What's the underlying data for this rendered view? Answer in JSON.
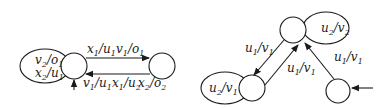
{
  "diagrams": [
    {
      "name": "left-automaton",
      "states": [
        {
          "id": "A",
          "initial": true
        },
        {
          "id": "B",
          "initial": false
        }
      ],
      "transitions": [
        {
          "from": "A",
          "to": "A",
          "labels": [
            {
              "in": "v",
              "in_sub": "2",
              "out": "o",
              "out_sub": "1"
            },
            {
              "in": "x",
              "in_sub": "2",
              "out": "u",
              "out_sub": "1"
            }
          ]
        },
        {
          "from": "A",
          "to": "B",
          "labels": [
            {
              "in": "x",
              "in_sub": "1",
              "out": "u",
              "out_sub": "1"
            },
            {
              "in": "v",
              "in_sub": "1",
              "out": "o",
              "out_sub": "1"
            }
          ]
        },
        {
          "from": "B",
          "to": "A",
          "labels": [
            {
              "in": "v",
              "in_sub": "1",
              "out": "u",
              "out_sub": "1"
            },
            {
              "in": "x",
              "in_sub": "1",
              "out": "u",
              "out_sub": "2"
            },
            {
              "in": "x",
              "in_sub": "2",
              "out": "o",
              "out_sub": "2"
            }
          ]
        }
      ]
    },
    {
      "name": "right-automaton",
      "states": [
        {
          "id": "T",
          "initial": false
        },
        {
          "id": "L",
          "initial": false
        },
        {
          "id": "R",
          "initial": true
        }
      ],
      "transitions": [
        {
          "from": "T",
          "to": "T",
          "labels": [
            {
              "in": "u",
              "in_sub": "2",
              "out": "v",
              "out_sub": "2"
            }
          ]
        },
        {
          "from": "T",
          "to": "L",
          "labels": [
            {
              "in": "u",
              "in_sub": "1",
              "out": "v",
              "out_sub": "1"
            }
          ]
        },
        {
          "from": "L",
          "to": "T",
          "labels": [
            {
              "in": "u",
              "in_sub": "1",
              "out": "v",
              "out_sub": "1"
            }
          ]
        },
        {
          "from": "L",
          "to": "L",
          "labels": [
            {
              "in": "u",
              "in_sub": "2",
              "out": "v",
              "out_sub": "1"
            }
          ]
        },
        {
          "from": "R",
          "to": "T",
          "labels": [
            {
              "in": "u",
              "in_sub": "1",
              "out": "v",
              "out_sub": "1"
            }
          ]
        }
      ]
    }
  ],
  "text": {
    "l_loop1_a": "v",
    "l_loop1_as": "2",
    "l_loop1_b": "/o",
    "l_loop1_bs": "1",
    "l_loop2_a": "x",
    "l_loop2_as": "2",
    "l_loop2_b": "/u",
    "l_loop2_bs": "1",
    "l_top1_a": "x",
    "l_top1_as": "1",
    "l_top1_b": "/u",
    "l_top1_bs": "1",
    "l_top2_a": "v",
    "l_top2_as": "1",
    "l_top2_b": "/o",
    "l_top2_bs": "1",
    "l_bot1_a": "v",
    "l_bot1_as": "1",
    "l_bot1_b": "/u",
    "l_bot1_bs": "1",
    "l_bot2_a": "x",
    "l_bot2_as": "1",
    "l_bot2_b": "/u",
    "l_bot2_bs": "2",
    "l_bot3_a": "x",
    "l_bot3_as": "2",
    "l_bot3_b": "/o",
    "l_bot3_bs": "2",
    "r_tloop_a": "u",
    "r_tloop_as": "2",
    "r_tloop_b": "/v",
    "r_tloop_bs": "2",
    "r_down_a": "u",
    "r_down_as": "1",
    "r_down_b": "/v",
    "r_down_bs": "1",
    "r_up_a": "u",
    "r_up_as": "1",
    "r_up_b": "/v",
    "r_up_bs": "1",
    "r_lloop_a": "u",
    "r_lloop_as": "2",
    "r_lloop_b": "/v",
    "r_lloop_bs": "1",
    "r_rt_a": "u",
    "r_rt_as": "1",
    "r_rt_b": "/v",
    "r_rt_bs": "1"
  }
}
